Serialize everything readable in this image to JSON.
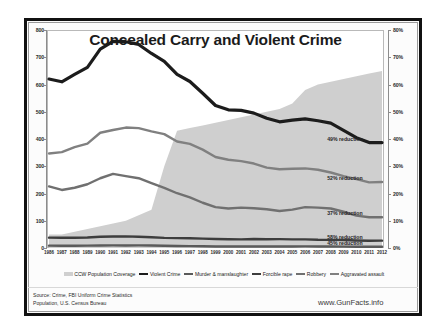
{
  "chart_data": {
    "type": "line",
    "title": "Concealed Carry and Violent Crime",
    "xlabel": "",
    "ylabel": "",
    "grid": false,
    "legend_position": "bottom",
    "x": [
      1986,
      1987,
      1988,
      1989,
      1990,
      1991,
      1992,
      1993,
      1994,
      1995,
      1996,
      1997,
      1998,
      1999,
      2000,
      2001,
      2002,
      2003,
      2004,
      2005,
      2006,
      2007,
      2008,
      2009,
      2010,
      2011,
      2012
    ],
    "categories": [
      "1986",
      "1987",
      "1988",
      "1989",
      "1990",
      "1991",
      "1992",
      "1993",
      "1994",
      "1995",
      "1996",
      "1997",
      "1998",
      "1999",
      "2000",
      "2001",
      "2002",
      "2003",
      "2004",
      "2005",
      "2006",
      "2007",
      "2008",
      "2009",
      "2010",
      "2011",
      "2012"
    ],
    "ylim": [
      0,
      800
    ],
    "ylim_right": [
      0,
      80
    ],
    "yticks": [
      "0",
      "100",
      "200",
      "300",
      "400",
      "500",
      "600",
      "700",
      "800"
    ],
    "yticks_right": [
      "0%",
      "10%",
      "20%",
      "30%",
      "40%",
      "50%",
      "60%",
      "70%",
      "80%"
    ],
    "series": [
      {
        "name": "CCW Population Coverage",
        "type": "area",
        "axis": "right",
        "color": "#cfcfcf",
        "values": [
          5,
          5,
          6,
          7,
          8,
          9,
          10,
          12,
          14,
          30,
          43,
          44,
          45,
          46,
          47,
          48,
          49,
          50,
          51,
          53,
          58,
          60,
          61,
          62,
          63,
          64,
          65
        ]
      },
      {
        "name": "Violent Crime",
        "type": "line",
        "axis": "left",
        "color": "#1c1c1c",
        "values": [
          620,
          610,
          637,
          663,
          730,
          758,
          757,
          747,
          714,
          685,
          637,
          611,
          568,
          523,
          507,
          505,
          495,
          476,
          463,
          469,
          474,
          467,
          458,
          432,
          405,
          387,
          387
        ]
      },
      {
        "name": "Murder & manslaughter",
        "type": "line",
        "axis": "left",
        "color": "#5a5a5a",
        "values": [
          8.6,
          8.3,
          8.4,
          8.7,
          9.4,
          9.8,
          9.3,
          9.5,
          9.0,
          8.2,
          7.4,
          6.8,
          6.3,
          5.7,
          5.5,
          5.6,
          5.6,
          5.7,
          5.5,
          5.6,
          5.8,
          5.7,
          5.4,
          5.0,
          4.8,
          4.7,
          4.7
        ]
      },
      {
        "name": "Forcible rape",
        "type": "line",
        "axis": "left",
        "color": "#3d3d3d",
        "values": [
          38,
          37.6,
          37.8,
          38.3,
          41.2,
          42.3,
          42.8,
          41.1,
          39.3,
          37.1,
          36.3,
          35.9,
          34.5,
          32.8,
          32,
          31.8,
          33.1,
          32.3,
          32.4,
          31.8,
          31.6,
          30,
          29.8,
          29.1,
          27.7,
          26.8,
          26.9
        ]
      },
      {
        "name": "Robbery",
        "type": "line",
        "axis": "left",
        "color": "#707070",
        "values": [
          226,
          213,
          221,
          234,
          256,
          272,
          264,
          256,
          238,
          221,
          201,
          186,
          166,
          150,
          145,
          148,
          146,
          142,
          136,
          141,
          150,
          148,
          145,
          133,
          119,
          113,
          113
        ]
      },
      {
        "name": "Aggravated assault",
        "type": "line",
        "axis": "left",
        "color": "#808080",
        "values": [
          347,
          352,
          370,
          383,
          423,
          433,
          442,
          440,
          428,
          418,
          391,
          382,
          361,
          334,
          324,
          319,
          310,
          295,
          289,
          291,
          292,
          287,
          277,
          264,
          253,
          241,
          242
        ]
      }
    ],
    "annotations": [
      {
        "label": "49% reduction",
        "x": 2011,
        "series": "Violent Crime"
      },
      {
        "label": "52% reduction",
        "x": 2011,
        "series": "Aggravated assault"
      },
      {
        "label": "37% reduction",
        "x": 2011,
        "series": "Robbery"
      },
      {
        "label": "58% reduction",
        "x": 2011,
        "series": "Forcible rape"
      },
      {
        "label": "45% reduction",
        "x": 2011,
        "series": "Murder & manslaughter"
      }
    ]
  },
  "legend": {
    "items": [
      {
        "label": "CCW Population Coverage",
        "color": "#cfcfcf",
        "kind": "area"
      },
      {
        "label": "Violent Crime",
        "color": "#1c1c1c",
        "kind": "line"
      },
      {
        "label": "Murder & manslaughter",
        "color": "#5a5a5a",
        "kind": "line"
      },
      {
        "label": "Forcible rape",
        "color": "#3d3d3d",
        "kind": "line"
      },
      {
        "label": "Robbery",
        "color": "#707070",
        "kind": "line"
      },
      {
        "label": "Aggravated assault",
        "color": "#808080",
        "kind": "line"
      }
    ]
  },
  "footer": {
    "source_line_1": "Source: Crime, FBI Uniform Crime Statistics",
    "source_line_2": "Population, U.S. Census Bureau",
    "website": "www.GunFacts.info"
  }
}
